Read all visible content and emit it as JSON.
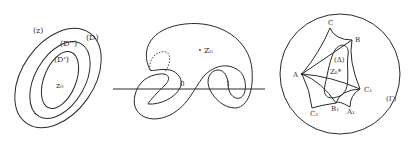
{
  "figure_1": {
    "labels": {
      "plane": "(z)",
      "outer": "(D)",
      "middle": "(D'')",
      "inner": "(D')",
      "center": "z₀"
    }
  },
  "figure_2": {
    "labels": {
      "point": "Z₀",
      "origin": "0",
      "one": "1"
    }
  },
  "figure_3": {
    "labels": {
      "A": "A",
      "B": "B",
      "C": "C",
      "A1": "A₁",
      "B1": "B₁",
      "C1": "C₁",
      "C2": "C₂",
      "delta": "(Δ)",
      "z0": "Z₀*",
      "gamma": "(Γ)"
    }
  }
}
